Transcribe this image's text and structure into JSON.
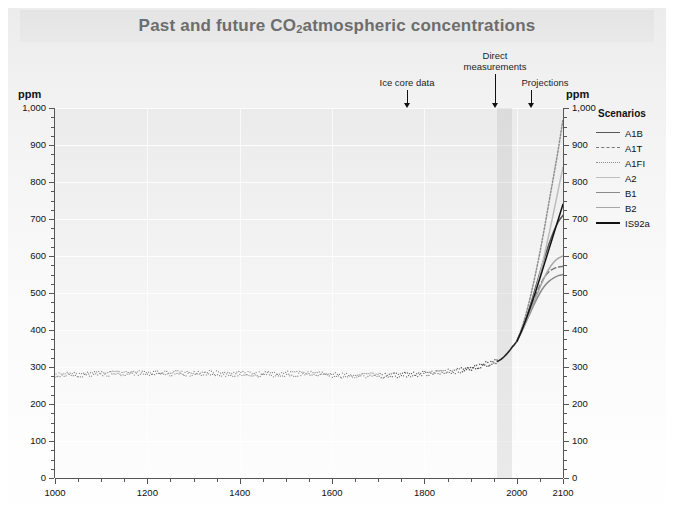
{
  "title": {
    "prefix": "Past and future CO",
    "sub": "2",
    "suffix": " atmospheric concentrations"
  },
  "annotations": [
    {
      "name": "ice-core-data",
      "label": "Ice core data",
      "line2": ""
    },
    {
      "name": "direct-measurements",
      "label": "Direct",
      "line2": "measurements"
    },
    {
      "name": "projections",
      "label": "Projections",
      "line2": ""
    }
  ],
  "axis_unit_left": "ppm",
  "axis_unit_right": "ppm",
  "legend": {
    "title": "Scenarios",
    "items": [
      {
        "label": "A1B",
        "color": "#555555",
        "style": "solid",
        "width": 1.6
      },
      {
        "label": "A1T",
        "color": "#777777",
        "style": "dashed",
        "width": 1.4
      },
      {
        "label": "A1FI",
        "color": "#8e8e8e",
        "style": "dotted",
        "width": 1.6
      },
      {
        "label": "A2",
        "color": "#bdbdbd",
        "style": "solid",
        "width": 1.6
      },
      {
        "label": "B1",
        "color": "#8a8a8a",
        "style": "solid",
        "width": 1.4
      },
      {
        "label": "B2",
        "color": "#a6a6a6",
        "style": "solid",
        "width": 1.4
      },
      {
        "label": "IS92a",
        "color": "#121212",
        "style": "solid",
        "width": 2.2
      }
    ]
  },
  "watermark": "",
  "chart_data": {
    "type": "line",
    "title": "Past and future CO2 atmospheric concentrations",
    "xlabel": "",
    "ylabel": "ppm",
    "xlim": [
      1000,
      2100
    ],
    "ylim": [
      0,
      1000
    ],
    "xticks": [
      1000,
      1200,
      1400,
      1600,
      1800,
      2000,
      2100
    ],
    "xtick_labels": [
      "1000",
      "1200",
      "1400",
      "1600",
      "1800",
      "2000",
      "2100"
    ],
    "xminor_step": 50,
    "yticks": [
      0,
      100,
      200,
      300,
      400,
      500,
      600,
      700,
      800,
      900,
      1000
    ],
    "ytick_labels": [
      "0",
      "100",
      "200",
      "300",
      "400",
      "500",
      "600",
      "700",
      "800",
      "900",
      "1,000"
    ],
    "yminor_step": 25,
    "grid": "horizontal-major-light",
    "legend_position": "right-outside",
    "shaded_bands": [
      {
        "name": "direct-measurements",
        "x0": 1958,
        "x1": 1990,
        "color": "rgba(150,150,150,0.18)"
      }
    ],
    "annotations": [
      {
        "text": "Ice core data",
        "x": 1820,
        "y_ppm": 960
      },
      {
        "text": "Direct measurements",
        "x": 1970,
        "y_ppm": 1010
      },
      {
        "text": "Projections",
        "x": 2050,
        "y_ppm": 960
      }
    ],
    "series": [
      {
        "name": "Ice core data",
        "type": "scatter",
        "marker": "dot",
        "color": "#4a4a4a",
        "x": [
          1000,
          1020,
          1040,
          1060,
          1080,
          1100,
          1120,
          1140,
          1160,
          1180,
          1200,
          1220,
          1240,
          1260,
          1280,
          1300,
          1320,
          1340,
          1360,
          1380,
          1400,
          1420,
          1440,
          1460,
          1480,
          1500,
          1520,
          1540,
          1560,
          1580,
          1600,
          1620,
          1640,
          1660,
          1680,
          1700,
          1720,
          1740,
          1760,
          1780,
          1800,
          1820,
          1840,
          1860,
          1880,
          1900,
          1920,
          1940,
          1958
        ],
        "y": [
          279,
          280,
          281,
          280,
          282,
          283,
          282,
          284,
          283,
          284,
          284,
          283,
          282,
          284,
          283,
          282,
          283,
          284,
          282,
          281,
          282,
          281,
          280,
          281,
          280,
          282,
          281,
          283,
          282,
          281,
          278,
          277,
          276,
          277,
          278,
          277,
          277,
          278,
          279,
          280,
          283,
          284,
          287,
          288,
          291,
          296,
          303,
          310,
          315
        ]
      },
      {
        "name": "Direct measurements",
        "type": "line",
        "color": "#222222",
        "width": 1.6,
        "x": [
          1958,
          1965,
          1970,
          1975,
          1980,
          1985,
          1990,
          1995,
          2000
        ],
        "y": [
          315,
          320,
          325,
          331,
          338,
          345,
          354,
          361,
          369
        ]
      },
      {
        "name": "A1B",
        "type": "line",
        "color": "#555555",
        "style": "solid",
        "x": [
          2000,
          2010,
          2020,
          2030,
          2040,
          2050,
          2060,
          2070,
          2080,
          2090,
          2100
        ],
        "y": [
          369,
          398,
          432,
          470,
          512,
          555,
          596,
          634,
          667,
          693,
          710
        ]
      },
      {
        "name": "A1T",
        "type": "line",
        "color": "#777777",
        "style": "dashed",
        "x": [
          2000,
          2010,
          2020,
          2030,
          2040,
          2050,
          2060,
          2070,
          2080,
          2090,
          2100
        ],
        "y": [
          369,
          396,
          427,
          460,
          492,
          520,
          543,
          558,
          566,
          570,
          572
        ]
      },
      {
        "name": "A1FI",
        "type": "line",
        "color": "#8e8e8e",
        "style": "dotted",
        "x": [
          2000,
          2010,
          2020,
          2030,
          2040,
          2050,
          2060,
          2070,
          2080,
          2090,
          2100
        ],
        "y": [
          369,
          403,
          444,
          493,
          549,
          610,
          677,
          748,
          818,
          890,
          970
        ]
      },
      {
        "name": "A2",
        "type": "line",
        "color": "#bdbdbd",
        "style": "solid",
        "x": [
          2000,
          2010,
          2020,
          2030,
          2040,
          2050,
          2060,
          2070,
          2080,
          2090,
          2100
        ],
        "y": [
          369,
          396,
          427,
          463,
          504,
          551,
          604,
          661,
          720,
          781,
          840
        ]
      },
      {
        "name": "B1",
        "type": "line",
        "color": "#8a8a8a",
        "style": "solid",
        "x": [
          2000,
          2010,
          2020,
          2030,
          2040,
          2050,
          2060,
          2070,
          2080,
          2090,
          2100
        ],
        "y": [
          369,
          394,
          421,
          449,
          476,
          500,
          519,
          532,
          541,
          547,
          550
        ]
      },
      {
        "name": "B2",
        "type": "line",
        "color": "#a6a6a6",
        "style": "solid",
        "x": [
          2000,
          2010,
          2020,
          2030,
          2040,
          2050,
          2060,
          2070,
          2080,
          2090,
          2100
        ],
        "y": [
          369,
          395,
          424,
          454,
          485,
          515,
          543,
          566,
          583,
          594,
          600
        ]
      },
      {
        "name": "IS92a",
        "type": "line",
        "color": "#121212",
        "style": "solid",
        "x": [
          2000,
          2010,
          2020,
          2030,
          2040,
          2050,
          2060,
          2070,
          2080,
          2090,
          2100
        ],
        "y": [
          369,
          397,
          429,
          464,
          501,
          540,
          580,
          620,
          660,
          700,
          740
        ]
      }
    ]
  }
}
